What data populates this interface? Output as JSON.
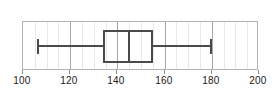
{
  "chart_data": {
    "type": "box",
    "title": "",
    "xlabel": "",
    "ylabel": "",
    "orientation": "horizontal",
    "xlim": [
      100,
      200
    ],
    "grid": true,
    "major_tick_step": 20,
    "minor_tick_step": 5,
    "legend": null,
    "tick_labels": [
      "100",
      "120",
      "140",
      "160",
      "180",
      "200"
    ],
    "ticks": [
      100,
      120,
      140,
      160,
      180,
      200
    ],
    "minor_ticks": [
      105,
      110,
      115,
      125,
      130,
      135,
      145,
      150,
      155,
      165,
      170,
      175,
      185,
      190,
      195
    ],
    "series": [
      {
        "name": "",
        "min": 106,
        "q1": 134,
        "median": 145,
        "q3": 155,
        "max": 180,
        "iqr": 21,
        "outliers": []
      }
    ],
    "colors": {
      "line": "#4a4a4a",
      "frame": "#b4b4b4",
      "major_grid": "#a8a8a8",
      "minor_grid": "#e8e8e8",
      "background": "#ffffff",
      "label": "#1a1a1a"
    }
  }
}
